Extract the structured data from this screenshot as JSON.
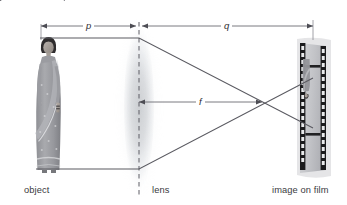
{
  "figure": {
    "caption_partial": "ject is the lens p and the distance from the lens to",
    "background_color": "#ffffff",
    "line_color": "#55555c",
    "text_color": "#3a3a40"
  },
  "dimensions": [
    {
      "symbol": "p",
      "name": "object-distance",
      "from": "object",
      "to": "lens"
    },
    {
      "symbol": "q",
      "name": "image-distance",
      "from": "lens",
      "to": "image on film"
    },
    {
      "symbol": "f",
      "name": "focal-length",
      "from": "lens",
      "to": "focal point"
    }
  ],
  "labels": {
    "object": "object",
    "lens": "lens",
    "image": "image on film",
    "p": "p",
    "q": "q",
    "f": "f"
  },
  "diagram_data": {
    "type": "optics-ray-diagram",
    "lens_type": "biconvex converging",
    "optical_axis_y": 102,
    "lens_center_x": 139,
    "object": {
      "x": 50,
      "top_y": 33,
      "bottom_y": 174,
      "description": "woman in sari, upright",
      "orientation": "upright"
    },
    "image": {
      "x": 313,
      "top_y": 78,
      "bottom_y": 128,
      "description": "reduced inverted image of woman on film",
      "orientation": "inverted"
    },
    "focal_point": {
      "x": 262,
      "y": 102
    },
    "rays": [
      {
        "name": "ray-from-head",
        "points": [
          [
            50,
            38
          ],
          [
            139,
            38
          ],
          [
            313,
            128
          ]
        ]
      },
      {
        "name": "ray-from-feet",
        "points": [
          [
            50,
            169
          ],
          [
            139,
            169
          ],
          [
            313,
            78
          ]
        ]
      }
    ],
    "dimension_lines": [
      {
        "symbol": "p",
        "y": 26,
        "x1": 41,
        "x2": 139
      },
      {
        "symbol": "q",
        "y": 26,
        "x1": 139,
        "x2": 313
      },
      {
        "symbol": "f",
        "y": 102,
        "x1": 139,
        "x2": 262
      }
    ]
  }
}
